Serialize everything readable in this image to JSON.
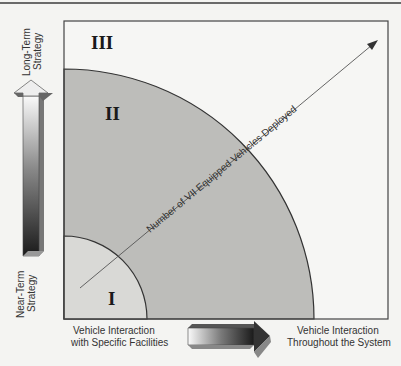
{
  "diagram": {
    "regions": [
      {
        "id": "I",
        "label": "I"
      },
      {
        "id": "II",
        "label": "II"
      },
      {
        "id": "III",
        "label": "III"
      }
    ],
    "diagonal_axis_label": "Number of VII Equipped Vehicles Deployed",
    "vertical_axis": {
      "top_label_line1": "Long-Term",
      "top_label_line2": "Strategy",
      "bottom_label_line1": "Near-Term",
      "bottom_label_line2": "Strategy"
    },
    "horizontal_axis": {
      "left_label_line1": "Vehicle Interaction",
      "left_label_line2": "with Specific Facilities",
      "right_label_line1": "Vehicle Interaction",
      "right_label_line2": "Throughout the System"
    },
    "colors": {
      "region_I": "#d9d9d6",
      "region_II": "#bdbdba",
      "region_III": "#f6f6f4",
      "frame": "#444444"
    }
  }
}
